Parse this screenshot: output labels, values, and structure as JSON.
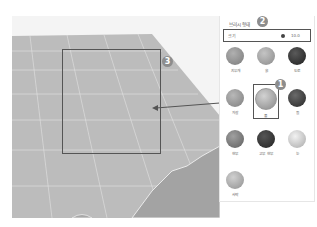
{
  "panel": {
    "title": "브러시 형태",
    "size_label": "크기",
    "size_value": "10.0",
    "materials": [
      {
        "label": "지우개",
        "color": "#8a8a8a"
      },
      {
        "label": "흙",
        "color": "#9a9a9a"
      },
      {
        "label": "도로",
        "color": "#2f2f2f"
      },
      {
        "label": "자갈",
        "color": "#8f8f8f"
      },
      {
        "label": "풀",
        "color": "#a4a4a4",
        "selected": true
      },
      {
        "label": "돌",
        "color": "#3b3b3b"
      },
      {
        "label": "현무",
        "color": "#7a7a7a"
      },
      {
        "label": "고무 현무",
        "color": "#353535"
      },
      {
        "label": "눈",
        "color": "#cfcfcf"
      },
      {
        "label": "사막",
        "color": "#b4b4b4"
      }
    ]
  },
  "callouts": {
    "one": "1",
    "two": "2",
    "three": "3"
  },
  "colors": {
    "terrain": "#b9b9b9",
    "outline": "#555555",
    "badge": "#8d8d8d"
  }
}
